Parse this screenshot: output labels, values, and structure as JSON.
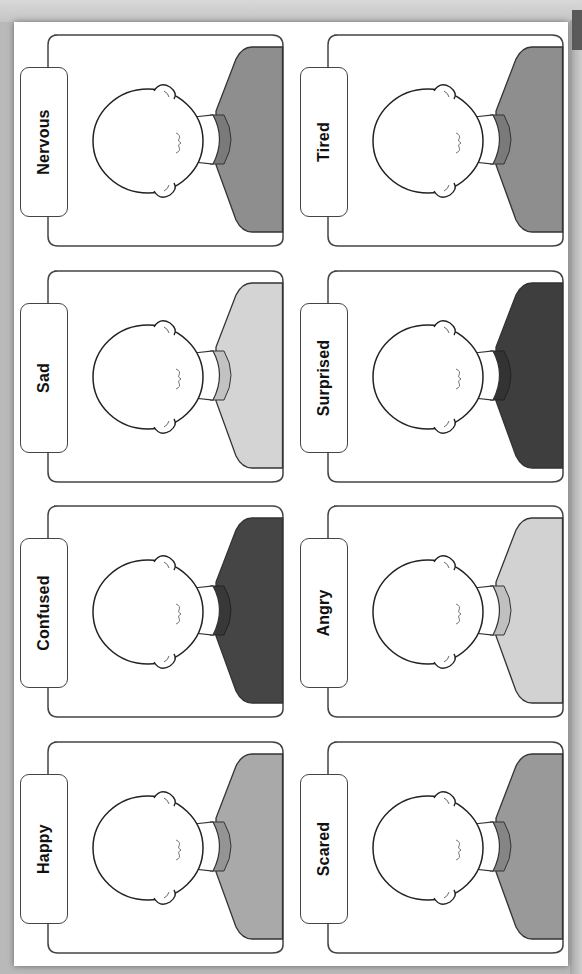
{
  "worksheet": {
    "orientation": "rotated-90",
    "cards": [
      {
        "label": "Nervous",
        "shirt_color": "#8e8e8e",
        "collar_color": "#7a7a7a"
      },
      {
        "label": "Tired",
        "shirt_color": "#8e8e8e",
        "collar_color": "#7a7a7a"
      },
      {
        "label": "Sad",
        "shirt_color": "#d4d4d4",
        "collar_color": "#c2c2c2"
      },
      {
        "label": "Surprised",
        "shirt_color": "#3e3e3e",
        "collar_color": "#333333"
      },
      {
        "label": "Confused",
        "shirt_color": "#454545",
        "collar_color": "#383838"
      },
      {
        "label": "Angry",
        "shirt_color": "#d2d2d2",
        "collar_color": "#c0c0c0"
      },
      {
        "label": "Happy",
        "shirt_color": "#a9a9a9",
        "collar_color": "#949494"
      },
      {
        "label": "Scared",
        "shirt_color": "#999999",
        "collar_color": "#858585"
      }
    ]
  }
}
